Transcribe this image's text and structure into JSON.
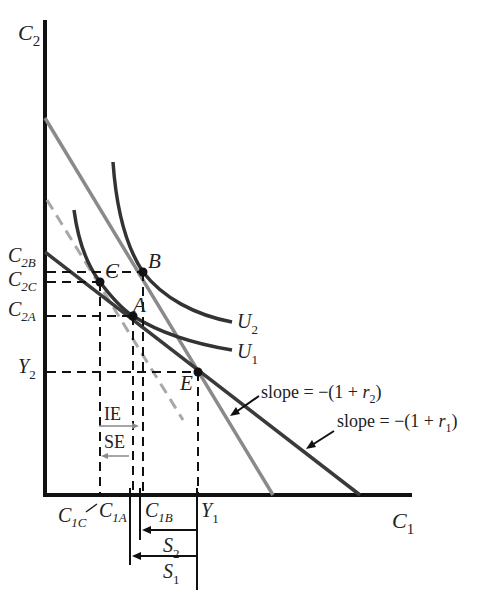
{
  "diagram": {
    "axes": {
      "y_label": "C",
      "y_sub": "2",
      "x_label": "C",
      "x_sub": "1"
    },
    "y_ticks": [
      {
        "main": "C",
        "sub": "2B"
      },
      {
        "main": "C",
        "sub": "2C"
      },
      {
        "main": "C",
        "sub": "2A"
      },
      {
        "main": "Y",
        "sub": "2"
      }
    ],
    "x_ticks": [
      {
        "main": "C",
        "sub": "1C"
      },
      {
        "main": "C",
        "sub": "1A"
      },
      {
        "main": "C",
        "sub": "1B"
      },
      {
        "main": "Y",
        "sub": "1"
      }
    ],
    "points": [
      {
        "name": "B"
      },
      {
        "name": "C"
      },
      {
        "name": "A"
      },
      {
        "name": "E"
      }
    ],
    "curves": [
      {
        "name": "U",
        "sub": "2"
      },
      {
        "name": "U",
        "sub": "1"
      }
    ],
    "annotations": {
      "slope_r2_prefix": "slope = −(1 + ",
      "slope_r2_var": "r",
      "slope_r2_sub": "2",
      "slope_r2_suffix": ")",
      "slope_r1_prefix": "slope = −(1 + ",
      "slope_r1_var": "r",
      "slope_r1_sub": "1",
      "slope_r1_suffix": ")",
      "income_effect": "IE",
      "substitution_effect": "SE",
      "savings_2": {
        "main": "S",
        "sub": "2"
      },
      "savings_1": {
        "main": "S",
        "sub": "1"
      }
    },
    "colors": {
      "axis": "#111111",
      "budget_r1": "#3a3a3a",
      "budget_r2": "#8a8a8a",
      "dashed_compensated": "#a8a8a8",
      "indifference": "#333333",
      "guides": "#111111"
    }
  }
}
